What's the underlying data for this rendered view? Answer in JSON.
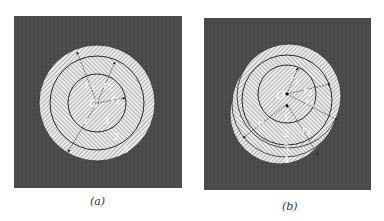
{
  "figure": {
    "panels": [
      {
        "id": "a",
        "caption": "(a)",
        "center_label": "O",
        "radius_labels": [
          "r3",
          "r2",
          "r1",
          "r"
        ],
        "radius_label_parts": [
          {
            "base": "r",
            "sub": "3"
          },
          {
            "base": "r",
            "sub": "2"
          },
          {
            "base": "r",
            "sub": "1"
          },
          {
            "base": "r",
            "sub": ""
          }
        ],
        "region_labels": [
          "1",
          "2",
          "3"
        ],
        "arrangement": "concentric"
      },
      {
        "id": "b",
        "caption": "(b)",
        "center_label": "O",
        "radius_labels": [
          "r1",
          "r2",
          "r3",
          "r4",
          "r"
        ],
        "radius_label_parts": [
          {
            "base": "r",
            "sub": "1"
          },
          {
            "base": "r",
            "sub": "2"
          },
          {
            "base": "r",
            "sub": "3"
          },
          {
            "base": "r",
            "sub": "4"
          },
          {
            "base": "r",
            "sub": ""
          }
        ],
        "region_labels": [
          "1",
          "2",
          "3",
          "4"
        ],
        "arrangement": "eccentric"
      }
    ],
    "colors": {
      "background": "#ffffff",
      "panel_fill": "#4a4a4a",
      "region_fill": "#e8e8e8",
      "hatch": "#6a6a6a",
      "outline": "#2a2a2a"
    }
  }
}
